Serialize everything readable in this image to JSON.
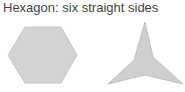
{
  "title": "Hexagon: six straight sides",
  "shapes": [
    {
      "name": "hexagon",
      "fill": "#d3d3d3",
      "stroke": "#c4c4c4",
      "points": "8,55 25,27 61,27 77,55 61,83 25,83"
    },
    {
      "name": "three-pointed-star",
      "fill": "#cfcfcf",
      "stroke": "#c0c0c0",
      "points": "145,22 153,57 183,84 145,75 108,84 134,60"
    }
  ]
}
